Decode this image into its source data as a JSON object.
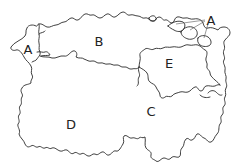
{
  "map": {
    "stroke_color": "#2a2a2a",
    "background": "#ffffff",
    "regions": [
      {
        "id": "A_west",
        "label": "A",
        "x": 28,
        "y": 49
      },
      {
        "id": "B",
        "label": "B",
        "x": 99,
        "y": 41
      },
      {
        "id": "A_northeast",
        "label": "A",
        "x": 211,
        "y": 20
      },
      {
        "id": "E",
        "label": "E",
        "x": 169,
        "y": 63
      },
      {
        "id": "C",
        "label": "C",
        "x": 151,
        "y": 111
      },
      {
        "id": "D",
        "label": "D",
        "x": 71,
        "y": 124
      }
    ]
  }
}
